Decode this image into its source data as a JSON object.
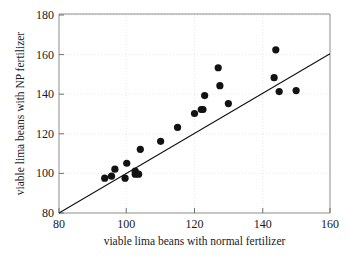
{
  "chart_data": {
    "type": "scatter",
    "title": "",
    "xlabel": "viable lima beans with normal fertilizer",
    "ylabel": "viable lima beans with NP fertilizer",
    "xlim": [
      80,
      160
    ],
    "ylim": [
      80,
      180
    ],
    "xticks": [
      80,
      100,
      120,
      140,
      160
    ],
    "yticks": [
      80,
      100,
      120,
      140,
      160,
      180
    ],
    "xtick_labels": [
      "80",
      "100",
      "120",
      "140",
      "160"
    ],
    "ytick_labels": [
      "80",
      "100",
      "120",
      "140",
      "160",
      "180"
    ],
    "grid": true,
    "legend": null,
    "marker": "filled-circle",
    "marker_color": "#121212",
    "points": [
      {
        "x": 93.5,
        "y": 97.5
      },
      {
        "x": 95.5,
        "y": 98.5
      },
      {
        "x": 96.5,
        "y": 102.0
      },
      {
        "x": 99.5,
        "y": 97.5
      },
      {
        "x": 100.0,
        "y": 105.0
      },
      {
        "x": 102.5,
        "y": 101.0
      },
      {
        "x": 102.5,
        "y": 99.5
      },
      {
        "x": 103.5,
        "y": 99.5
      },
      {
        "x": 104.0,
        "y": 112.0
      },
      {
        "x": 110.0,
        "y": 116.0
      },
      {
        "x": 115.0,
        "y": 123.0
      },
      {
        "x": 120.0,
        "y": 130.0
      },
      {
        "x": 122.0,
        "y": 132.0
      },
      {
        "x": 122.5,
        "y": 132.0
      },
      {
        "x": 123.0,
        "y": 139.0
      },
      {
        "x": 127.0,
        "y": 153.0
      },
      {
        "x": 127.5,
        "y": 144.0
      },
      {
        "x": 130.0,
        "y": 135.0
      },
      {
        "x": 143.5,
        "y": 148.0
      },
      {
        "x": 144.0,
        "y": 162.0
      },
      {
        "x": 145.0,
        "y": 141.0
      },
      {
        "x": 150.0,
        "y": 141.5
      }
    ],
    "reference_line": {
      "name": "identity-line",
      "x0": 80,
      "y0": 80,
      "x1": 160,
      "y1": 160,
      "color": "#111111"
    }
  },
  "axes": {
    "x_label": "viable lima beans with normal fertilizer",
    "y_label": "viable lima beans with NP fertilizer"
  }
}
